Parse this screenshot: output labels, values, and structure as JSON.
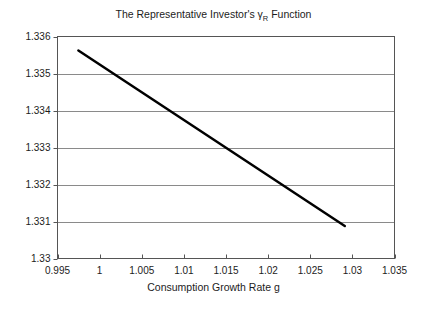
{
  "figure": {
    "background_color": "#ffffff",
    "title_prefix": "The Representative Investor's ",
    "title_symbol": "γ",
    "title_subscript": "R",
    "title_suffix": " Function",
    "title_full": "The Representative Investor's γR Function"
  },
  "chart_data": {
    "type": "line",
    "title": "The Representative Investor's γR Function",
    "xlabel": "Consumption Growth Rate g",
    "ylabel": "",
    "xlim": [
      0.995,
      1.035
    ],
    "ylim": [
      1.33,
      1.336
    ],
    "xticks": [
      0.995,
      1,
      1.005,
      1.01,
      1.015,
      1.02,
      1.025,
      1.03,
      1.035
    ],
    "xtick_labels": [
      "0.995",
      "1",
      "1.005",
      "1.01",
      "1.015",
      "1.02",
      "1.025",
      "1.03",
      "1.035"
    ],
    "yticks": [
      1.33,
      1.331,
      1.332,
      1.333,
      1.334,
      1.335,
      1.336
    ],
    "ytick_labels": [
      "1.33",
      "1.331",
      "1.332",
      "1.333",
      "1.334",
      "1.335",
      "1.336"
    ],
    "grid": "horizontal",
    "grid_color": "#8a8a8a",
    "legend": "none",
    "series": [
      {
        "name": "gamma_R",
        "color": "#000000",
        "line_width": 2.5,
        "x": [
          0.99748,
          1.0,
          1.005,
          1.01,
          1.015,
          1.02,
          1.025,
          1.0291
        ],
        "y": [
          1.33562,
          1.335242,
          1.334492,
          1.333742,
          1.332992,
          1.332242,
          1.331492,
          1.330877
        ]
      }
    ]
  }
}
